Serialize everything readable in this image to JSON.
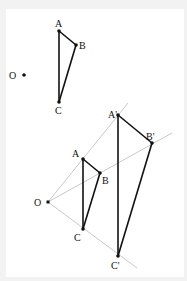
{
  "figure": {
    "colors": {
      "background": "#f2f2f2",
      "panel": "#ffffff",
      "segment": "#111111",
      "ray": "#bbbbbb"
    },
    "original": {
      "center_label": "O",
      "points": [
        {
          "label": "A",
          "x": 59,
          "y": 31,
          "lx": 55,
          "ly": 27
        },
        {
          "label": "B",
          "x": 76,
          "y": 45,
          "lx": 79,
          "ly": 49
        },
        {
          "label": "C",
          "x": 59,
          "y": 102,
          "lx": 55,
          "ly": 114
        }
      ],
      "center": {
        "x": 24,
        "y": 75,
        "lx": 9,
        "ly": 79
      }
    },
    "dilated": {
      "center": {
        "label": "O",
        "x": 48,
        "y": 202,
        "lx": 34,
        "ly": 206
      },
      "image_points": [
        {
          "label": "A",
          "x": 83,
          "y": 159,
          "lx": 72,
          "ly": 157
        },
        {
          "label": "B",
          "x": 100,
          "y": 173,
          "lx": 102,
          "ly": 184
        },
        {
          "label": "C",
          "x": 83,
          "y": 229,
          "lx": 74,
          "ly": 241
        },
        {
          "label": "A'",
          "x": 118,
          "y": 115,
          "lx": 108,
          "ly": 118
        },
        {
          "label": "B'",
          "x": 152,
          "y": 143,
          "lx": 146,
          "ly": 140
        },
        {
          "label": "C'",
          "x": 118,
          "y": 256,
          "lx": 111,
          "ly": 269
        }
      ],
      "rays": [
        {
          "through": "A'",
          "x2": 128,
          "y2": 103
        },
        {
          "through": "B'",
          "x2": 172,
          "y2": 133
        },
        {
          "through": "C'",
          "x2": 137,
          "y2": 268
        }
      ]
    }
  }
}
